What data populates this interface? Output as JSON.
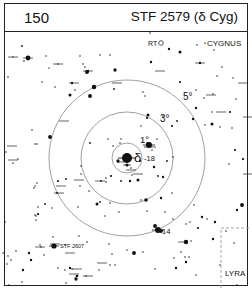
{
  "header": {
    "chart_number": "150",
    "title": "STF 2579 (δ Cyg)"
  },
  "labels": {
    "constellation_main": "CYGNUS",
    "constellation_secondary": "LYRA",
    "variable_star": "RT",
    "companion": "STF 2607",
    "primary_star": "δ",
    "primary_mag": "-18",
    "star_14": "14",
    "ring_1": "1°",
    "ring_3": "3°",
    "ring_5": "5°"
  },
  "colors": {
    "ink": "#111111",
    "ring": "#888888",
    "boundary": "#999999"
  },
  "field": {
    "center": [
      127,
      158
    ],
    "rings": [
      {
        "label_key": "ring_1",
        "radius": 15
      },
      {
        "label_key": "ring_3",
        "radius": 46
      },
      {
        "label_key": "ring_5",
        "radius": 78
      }
    ]
  },
  "stars": [
    [
      22,
      46,
      1.2
    ],
    [
      27,
      57,
      1.5
    ],
    [
      13,
      57,
      0.9
    ],
    [
      24,
      61,
      1.1
    ],
    [
      28,
      58,
      3.2
    ],
    [
      46,
      56,
      1
    ],
    [
      58,
      64,
      1
    ],
    [
      49,
      68,
      0.9
    ],
    [
      42,
      82,
      1
    ],
    [
      55,
      87,
      1
    ],
    [
      8,
      77,
      1
    ],
    [
      80,
      56,
      1
    ],
    [
      88,
      71,
      1.6
    ],
    [
      87,
      72,
      2.6
    ],
    [
      72,
      83,
      1.6
    ],
    [
      83,
      64,
      1
    ],
    [
      70,
      95,
      2
    ],
    [
      90,
      96,
      2.6
    ],
    [
      94,
      87,
      3
    ],
    [
      85,
      67,
      1
    ],
    [
      75,
      90,
      1
    ],
    [
      115,
      70,
      2.2
    ],
    [
      100,
      55,
      1
    ],
    [
      110,
      55,
      1
    ],
    [
      114,
      89,
      1.2
    ],
    [
      150,
      33,
      1
    ],
    [
      169,
      49,
      1.6
    ],
    [
      180,
      52,
      2
    ],
    [
      197,
      45,
      1
    ],
    [
      151,
      62,
      1.6
    ],
    [
      180,
      82,
      1.4
    ],
    [
      205,
      43,
      1
    ],
    [
      214,
      50,
      1
    ],
    [
      222,
      67,
      1
    ],
    [
      217,
      76,
      1
    ],
    [
      233,
      78,
      1
    ],
    [
      236,
      99,
      1
    ],
    [
      204,
      98,
      1
    ],
    [
      213,
      94,
      1
    ],
    [
      196,
      108,
      1.6
    ],
    [
      205,
      125,
      1
    ],
    [
      220,
      127,
      1
    ],
    [
      232,
      128,
      1
    ],
    [
      200,
      63,
      1.6
    ],
    [
      145,
      96,
      1
    ],
    [
      143,
      92,
      1
    ],
    [
      148,
      115,
      2
    ],
    [
      147,
      118,
      1.4
    ],
    [
      163,
      116,
      1
    ],
    [
      141,
      126,
      1
    ],
    [
      177,
      121,
      1.2
    ],
    [
      172,
      126,
      1.4
    ],
    [
      212,
      112,
      1
    ],
    [
      230,
      112,
      1.4
    ],
    [
      196,
      90,
      1
    ],
    [
      193,
      119,
      1.6
    ],
    [
      212,
      124,
      2
    ],
    [
      235,
      150,
      1.4
    ],
    [
      229,
      164,
      1
    ],
    [
      243,
      159,
      1.5
    ],
    [
      32,
      130,
      1
    ],
    [
      18,
      159,
      1
    ],
    [
      6,
      152,
      1
    ],
    [
      13,
      163,
      1
    ],
    [
      35,
      144,
      1
    ],
    [
      37,
      144,
      1
    ],
    [
      50,
      137,
      2.6
    ],
    [
      37,
      183,
      1
    ],
    [
      58,
      181,
      1.4
    ],
    [
      35,
      186,
      1
    ],
    [
      34,
      188,
      1
    ],
    [
      57,
      193,
      1.2
    ],
    [
      66,
      179,
      1.2
    ],
    [
      45,
      204,
      1.2
    ],
    [
      38,
      207,
      1
    ],
    [
      78,
      207,
      1
    ],
    [
      5,
      222,
      1
    ],
    [
      36,
      216,
      1
    ],
    [
      36,
      220,
      1
    ],
    [
      80,
      186,
      1
    ],
    [
      90,
      143,
      1.2
    ],
    [
      81,
      166,
      1
    ],
    [
      81,
      174,
      1
    ],
    [
      89,
      191,
      1
    ],
    [
      106,
      178,
      1
    ],
    [
      106,
      182,
      1
    ],
    [
      111,
      176,
      1.4
    ],
    [
      101,
      181,
      1.2
    ],
    [
      118,
      161,
      2.2
    ],
    [
      138,
      180,
      2
    ],
    [
      121,
      139,
      1
    ],
    [
      120,
      143,
      1
    ],
    [
      108,
      139,
      1
    ],
    [
      121,
      181,
      1.2
    ],
    [
      130,
      181,
      1.6
    ],
    [
      148,
      144,
      1.2
    ],
    [
      157,
      139,
      1
    ],
    [
      152,
      150,
      1
    ],
    [
      145,
      147,
      1
    ],
    [
      148,
      144,
      2.6
    ],
    [
      154,
      167,
      1.6
    ],
    [
      167,
      161,
      1.2
    ],
    [
      158,
      176,
      1.2
    ],
    [
      161,
      198,
      1.6
    ],
    [
      172,
      193,
      1
    ],
    [
      146,
      200,
      2.4
    ],
    [
      173,
      157,
      1
    ],
    [
      163,
      177,
      1.6
    ],
    [
      113,
      146,
      1
    ],
    [
      140,
      161,
      1.4
    ],
    [
      131,
      168,
      1
    ],
    [
      132,
      175,
      1
    ],
    [
      100,
      202,
      1
    ],
    [
      100,
      202,
      1
    ],
    [
      97,
      204,
      2
    ],
    [
      110,
      203,
      1
    ],
    [
      119,
      212,
      1
    ],
    [
      105,
      216,
      1
    ],
    [
      147,
      211,
      1
    ],
    [
      165,
      212,
      1
    ],
    [
      141,
      200,
      1
    ],
    [
      155,
      226,
      2.6
    ],
    [
      161,
      231,
      2.6
    ],
    [
      186,
      224,
      1
    ],
    [
      190,
      222,
      1
    ],
    [
      198,
      228,
      1.4
    ],
    [
      215,
      222,
      1.6
    ],
    [
      207,
      219,
      1
    ],
    [
      191,
      241,
      1
    ],
    [
      173,
      219,
      1
    ],
    [
      194,
      205,
      1
    ],
    [
      35,
      215,
      1
    ],
    [
      38,
      214,
      1.5
    ],
    [
      52,
      208,
      1
    ],
    [
      16,
      251,
      1
    ],
    [
      11,
      260,
      1
    ],
    [
      53,
      237,
      1
    ],
    [
      79,
      236,
      1
    ],
    [
      87,
      242,
      1
    ],
    [
      65,
      245,
      1
    ],
    [
      31,
      260,
      1.6
    ],
    [
      41,
      247,
      1
    ],
    [
      40,
      245,
      1
    ],
    [
      65,
      270,
      1
    ],
    [
      70,
      268,
      1.6
    ],
    [
      58,
      268,
      1
    ],
    [
      77,
      276,
      1.8
    ],
    [
      72,
      269,
      1
    ],
    [
      86,
      276,
      1
    ],
    [
      23,
      270,
      1.6
    ],
    [
      110,
      265,
      1
    ],
    [
      115,
      265,
      1
    ],
    [
      99,
      270,
      1
    ],
    [
      155,
      269,
      1
    ],
    [
      186,
      262,
      1.6
    ],
    [
      186,
      242,
      3
    ],
    [
      189,
      257,
      1
    ],
    [
      185,
      257,
      1
    ],
    [
      174,
      258,
      1
    ],
    [
      181,
      252,
      1
    ],
    [
      202,
      217,
      1.6
    ],
    [
      213,
      239,
      1.6
    ],
    [
      226,
      231,
      1
    ],
    [
      234,
      243,
      1
    ],
    [
      237,
      285,
      1
    ],
    [
      134,
      253,
      2.6
    ],
    [
      109,
      244,
      1
    ],
    [
      112,
      254,
      1
    ],
    [
      127,
      250,
      1
    ],
    [
      143,
      252,
      1
    ],
    [
      176,
      268,
      1.6
    ],
    [
      196,
      275,
      1
    ],
    [
      220,
      265,
      1
    ],
    [
      237,
      210,
      1.6
    ],
    [
      242,
      205,
      2.6
    ],
    [
      7,
      264,
      1
    ],
    [
      44,
      255,
      1
    ],
    [
      3,
      253,
      1
    ],
    [
      8,
      256,
      1
    ],
    [
      29,
      253,
      1.6
    ],
    [
      22,
      282,
      1
    ],
    [
      9,
      285,
      1
    ],
    [
      76,
      279,
      2.2
    ],
    [
      66,
      283,
      1
    ]
  ],
  "ticked_stars": [
    [
      13,
      57
    ],
    [
      28,
      58
    ],
    [
      74,
      83
    ],
    [
      88,
      71
    ],
    [
      58,
      64
    ],
    [
      160,
      71
    ],
    [
      200,
      63
    ],
    [
      243,
      83
    ],
    [
      117,
      83
    ],
    [
      211,
      95
    ],
    [
      151,
      147
    ],
    [
      131,
      170
    ],
    [
      100,
      181
    ],
    [
      64,
      121
    ],
    [
      79,
      180
    ],
    [
      59,
      193
    ],
    [
      61,
      186
    ],
    [
      138,
      174
    ],
    [
      122,
      162
    ],
    [
      127,
      158
    ],
    [
      40,
      247
    ],
    [
      55,
      244
    ],
    [
      70,
      253
    ],
    [
      77,
      269
    ],
    [
      74,
      274
    ],
    [
      88,
      276
    ],
    [
      102,
      263
    ],
    [
      183,
      242
    ],
    [
      248,
      117
    ],
    [
      221,
      112
    ],
    [
      248,
      174
    ],
    [
      12,
      146
    ],
    [
      13,
      160
    ]
  ],
  "primary": {
    "pos": [
      127,
      158
    ],
    "size": 5
  },
  "secondary_labelled": [
    {
      "key": "ring_1_star",
      "pos": [
        149,
        145
      ],
      "size": 3
    },
    {
      "key": "star_14",
      "pos": [
        158,
        230
      ],
      "size": 3
    }
  ],
  "stf2607": {
    "pos": [
      54,
      246
    ],
    "size": 2.6
  },
  "rt_star": {
    "pos": [
      161,
      43
    ]
  }
}
